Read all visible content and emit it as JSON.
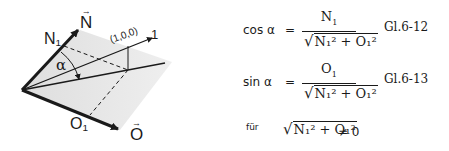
{
  "diagram": {
    "labels": {
      "n_vec": "N",
      "n1": "N",
      "n1_sub": "1",
      "unit_vec": "(1,0,0)",
      "unit_tip": "1",
      "alpha": "α",
      "o1": "O",
      "o1_sub": "1",
      "o_vec": "O",
      "arrow_glyph": "→"
    },
    "colors": {
      "plane_fill": "#e4e4e4",
      "stroke": "#1a1a1a"
    }
  },
  "equations": [
    {
      "lhs": "cos α",
      "equals": "=",
      "numerator": "N",
      "numerator_sub": "1",
      "denominator": "N₁² + O₁²",
      "label": "Gl.6-12"
    },
    {
      "lhs": "sin α",
      "equals": "=",
      "numerator": "O",
      "numerator_sub": "1",
      "denominator": "N₁² + O₁²",
      "label": "Gl.6-13"
    }
  ],
  "condition": {
    "prefix": "für",
    "expression": "N₁² + O₁²",
    "relation": "≠ 0"
  }
}
